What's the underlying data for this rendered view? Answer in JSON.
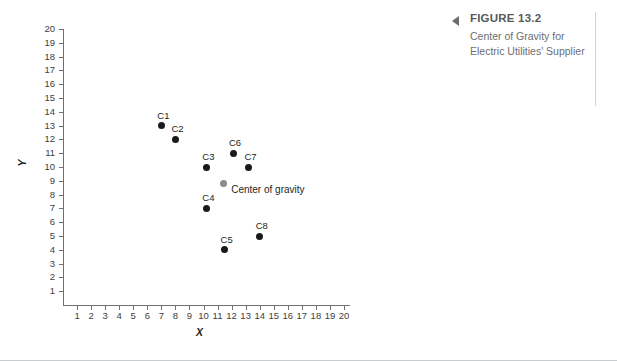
{
  "caption": {
    "arrow_icon": "left-triangle-icon",
    "title": "FIGURE 13.2",
    "subtitle": "Center of Gravity for Electric Utilities' Supplier"
  },
  "chart_data": {
    "type": "scatter",
    "title": "Center of Gravity for Electric Utilities' Supplier",
    "xlabel": "X",
    "ylabel": "Y",
    "xlim": [
      0,
      20.5
    ],
    "ylim": [
      0,
      20.8
    ],
    "grid": false,
    "legend": "none",
    "xticks": [
      1,
      2,
      3,
      4,
      5,
      6,
      7,
      8,
      9,
      10,
      11,
      12,
      13,
      14,
      15,
      16,
      17,
      18,
      19,
      20
    ],
    "yticks": [
      1,
      2,
      3,
      4,
      5,
      6,
      7,
      8,
      9,
      10,
      11,
      12,
      13,
      14,
      15,
      16,
      17,
      18,
      19,
      20
    ],
    "series": [
      {
        "name": "Sites",
        "color": "#1a1a1a",
        "points": [
          {
            "label": "C1",
            "x": 7.0,
            "y": 13.0
          },
          {
            "label": "C2",
            "x": 8.0,
            "y": 12.0
          },
          {
            "label": "C3",
            "x": 10.2,
            "y": 10.0
          },
          {
            "label": "C4",
            "x": 10.2,
            "y": 7.0
          },
          {
            "label": "C5",
            "x": 11.5,
            "y": 4.0
          },
          {
            "label": "C6",
            "x": 12.1,
            "y": 11.0
          },
          {
            "label": "C7",
            "x": 13.2,
            "y": 10.0
          },
          {
            "label": "C8",
            "x": 14.0,
            "y": 5.0
          }
        ]
      },
      {
        "name": "Center of gravity",
        "color": "#8c8c8c",
        "points": [
          {
            "label": "Center of gravity",
            "x": 11.4,
            "y": 8.8
          }
        ]
      }
    ]
  }
}
